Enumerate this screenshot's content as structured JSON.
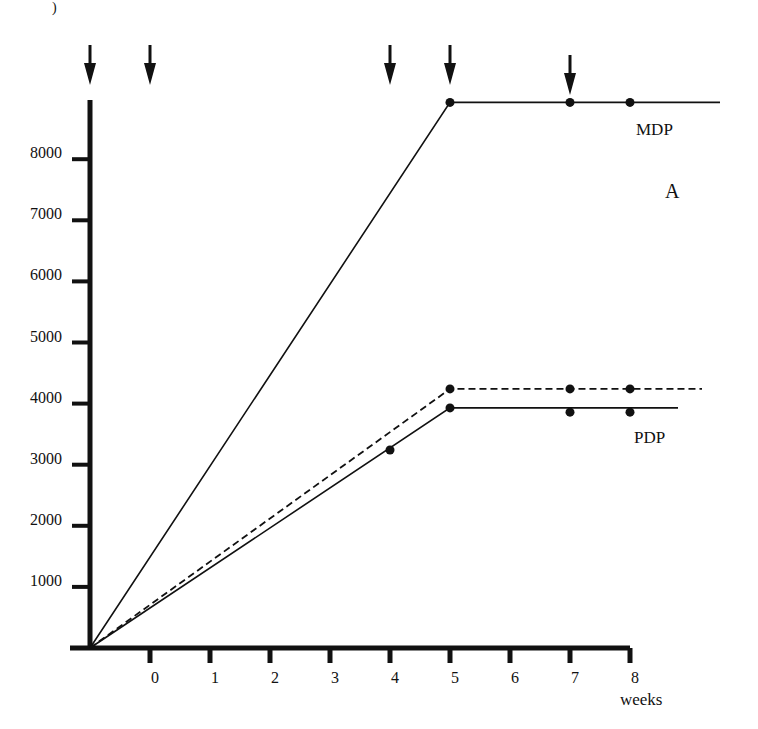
{
  "chart_data": {
    "type": "line",
    "title": "",
    "panel_label": "A",
    "xlabel": "weeks",
    "ylabel": "",
    "x_ticks": [
      "0",
      "1",
      "2",
      "3",
      "4",
      "5",
      "6",
      "7",
      "8"
    ],
    "y_ticks": [
      "1000",
      "2000",
      "3000",
      "4000",
      "5000",
      "6000",
      "7000",
      "8000"
    ],
    "xlim": [
      -1,
      8
    ],
    "ylim": [
      0,
      9000
    ],
    "grid": false,
    "legend": "none (inline labels)",
    "arrows_at_weeks": [
      -1,
      0,
      4,
      5,
      7
    ],
    "series": [
      {
        "name": "MDP",
        "style": "solid",
        "line": [
          {
            "x": -1,
            "y": 0
          },
          {
            "x": 5,
            "y": 8930
          },
          {
            "x": 9.5,
            "y": 8930
          }
        ],
        "points": [
          {
            "x": 5,
            "y": 8930
          },
          {
            "x": 7,
            "y": 8930
          },
          {
            "x": 8,
            "y": 8930
          }
        ]
      },
      {
        "name": "PDP (dashed)",
        "style": "dashed",
        "line": [
          {
            "x": -1,
            "y": 0
          },
          {
            "x": 5,
            "y": 4240
          },
          {
            "x": 9.2,
            "y": 4240
          }
        ],
        "points": [
          {
            "x": 5,
            "y": 4240
          },
          {
            "x": 7,
            "y": 4240
          },
          {
            "x": 8,
            "y": 4240
          }
        ]
      },
      {
        "name": "PDP",
        "style": "solid",
        "line": [
          {
            "x": -1,
            "y": 0
          },
          {
            "x": 5,
            "y": 3930
          },
          {
            "x": 8.8,
            "y": 3930
          }
        ],
        "points": [
          {
            "x": 4,
            "y": 3240
          },
          {
            "x": 5,
            "y": 3930
          },
          {
            "x": 7,
            "y": 3860
          },
          {
            "x": 8,
            "y": 3860
          }
        ]
      }
    ],
    "annotations": [
      {
        "text": "MDP",
        "near": "upper plateau"
      },
      {
        "text": "PDP",
        "near": "lower solid plateau"
      },
      {
        "text": "A",
        "position": "top-right"
      }
    ]
  },
  "labels": {
    "mdp": "MDP",
    "pdp": "PDP",
    "panel": "A",
    "xlabel": "weeks",
    "corner_mark": ")"
  }
}
